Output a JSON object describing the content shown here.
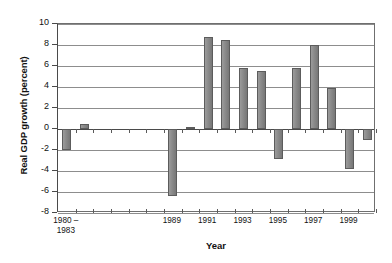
{
  "chart_data": {
    "type": "bar",
    "title": "",
    "xlabel": "Year",
    "ylabel": "Real GDP growth (percent)",
    "ylim": [
      -8,
      10
    ],
    "ytick_values": [
      10,
      8,
      6,
      4,
      2,
      0,
      -2,
      -4,
      -6,
      -8
    ],
    "ytick_labels": [
      "10",
      "8",
      "6",
      "4",
      "2",
      "0",
      "-2",
      "-4",
      "-6",
      "-8"
    ],
    "grid": true,
    "legend": "none",
    "bar_color": "#8e8e8e",
    "bar_edge_color": "#5c5c5c",
    "categories": [
      "1980 –\n1983",
      "1984",
      "1985",
      "1986",
      "1987",
      "1988",
      "1989",
      "1990",
      "1991",
      "1992",
      "1993",
      "1994",
      "1995",
      "1996",
      "1997",
      "1998",
      "1999",
      "2000"
    ],
    "xtick_labels": [
      "1980 –",
      "",
      "",
      "",
      "",
      "",
      "1989",
      "",
      "1991",
      "",
      "1993",
      "",
      "1995",
      "",
      "1997",
      "",
      "1999",
      ""
    ],
    "xtick_label_line2": "1983",
    "values": [
      -2.0,
      0.5,
      0.0,
      0.0,
      0.0,
      0.0,
      -6.4,
      0.2,
      8.8,
      8.5,
      5.8,
      5.5,
      -2.9,
      5.8,
      8.0,
      3.9,
      -3.8,
      -1.0
    ]
  }
}
